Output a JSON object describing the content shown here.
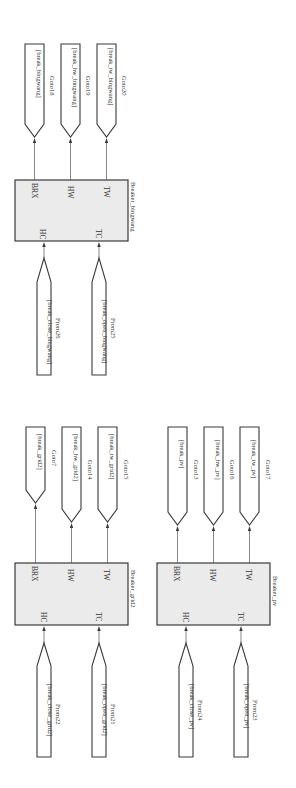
{
  "diagram": {
    "orientation": "rotated-90-clockwise",
    "colors": {
      "block_fill": "#ebebeb",
      "stroke": "#3a3a3a",
      "wire": "#6a6a6a",
      "text": "#333333"
    },
    "subsystems": [
      {
        "name": "Breaker_bingwang",
        "input_ports": [
          "HC",
          "TC"
        ],
        "output_ports": [
          "BRX",
          "HW",
          "TW"
        ],
        "from_blocks": [
          {
            "tag": "[break_close_bingwang]",
            "name": "From26",
            "port": "HC"
          },
          {
            "tag": "[break_open_bingwang]",
            "name": "From25",
            "port": "TC"
          }
        ],
        "goto_blocks": [
          {
            "tag": "[break_bingwang]",
            "name": "Goto18",
            "port": "BRX"
          },
          {
            "tag": "[break_hw_bingwang]",
            "name": "Goto19",
            "port": "HW"
          },
          {
            "tag": "[break_tw_bingwang]",
            "name": "Goto20",
            "port": "TW"
          }
        ]
      },
      {
        "name": "Breaker_grid2",
        "input_ports": [
          "HC",
          "TC"
        ],
        "output_ports": [
          "BRX",
          "HW",
          "TW"
        ],
        "from_blocks": [
          {
            "tag": "[break_close_grid2]",
            "name": "From22",
            "port": "HC"
          },
          {
            "tag": "[break_open_grid2]",
            "name": "From21",
            "port": "TC"
          }
        ],
        "goto_blocks": [
          {
            "tag": "[break_grid2]",
            "name": "Goto7",
            "port": "BRX"
          },
          {
            "tag": "[break_hw_grid2]",
            "name": "Goto14",
            "port": "HW"
          },
          {
            "tag": "[break_tw_grid2]",
            "name": "Goto15",
            "port": "TW"
          }
        ]
      },
      {
        "name": "Breaker_pv",
        "input_ports": [
          "HC",
          "TC"
        ],
        "output_ports": [
          "BRX",
          "HW",
          "TW"
        ],
        "from_blocks": [
          {
            "tag": "[break_close_pv]",
            "name": "From24",
            "port": "HC"
          },
          {
            "tag": "[break_open_pv]",
            "name": "From23",
            "port": "TC"
          }
        ],
        "goto_blocks": [
          {
            "tag": "[break_pv]",
            "name": "Goto13",
            "port": "BRX"
          },
          {
            "tag": "[break_hw_pv]",
            "name": "Goto16",
            "port": "HW"
          },
          {
            "tag": "[break_tw_pv]",
            "name": "Goto17",
            "port": "TW"
          }
        ]
      }
    ]
  }
}
